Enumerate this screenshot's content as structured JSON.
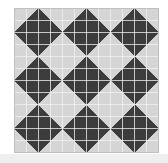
{
  "artwork": {
    "title": "Quilt block pattern",
    "kind": "patchwork-quilt-grid",
    "description": "Monochrome patchwork quilt swatch of repeating pinwheel / friendship star blocks",
    "grid": {
      "cells_across": 12,
      "cells_down": 12,
      "block_size_cells": 4,
      "blocks_across": 3,
      "blocks_down": 3,
      "cell_px": 12.0833
    },
    "colors": {
      "light_patch": "#d5d5d5",
      "dark_patch": "#3c3c3c",
      "seam_line": "#f2f2f2",
      "background": "#ffffff",
      "bottom_band": "#efefef",
      "outer_edge": "#bdbdbd"
    },
    "block_pattern": {
      "name": "pinwheel-star",
      "note": "Each 4x4 block: dark 2x2 center offset plus four half-square-triangle points spinning clockwise",
      "units": [
        {
          "row": 0,
          "col": 1,
          "type": "hst",
          "orientation": "br"
        },
        {
          "row": 0,
          "col": 2,
          "type": "hst",
          "orientation": "bl"
        },
        {
          "row": 1,
          "col": 0,
          "type": "hst",
          "orientation": "br"
        },
        {
          "row": 1,
          "col": 1,
          "type": "solid-dark"
        },
        {
          "row": 1,
          "col": 2,
          "type": "solid-dark"
        },
        {
          "row": 1,
          "col": 3,
          "type": "hst",
          "orientation": "bl"
        },
        {
          "row": 2,
          "col": 0,
          "type": "hst",
          "orientation": "tr"
        },
        {
          "row": 2,
          "col": 1,
          "type": "solid-dark"
        },
        {
          "row": 2,
          "col": 2,
          "type": "solid-dark"
        },
        {
          "row": 2,
          "col": 3,
          "type": "hst",
          "orientation": "tl"
        },
        {
          "row": 3,
          "col": 1,
          "type": "hst",
          "orientation": "tr"
        },
        {
          "row": 3,
          "col": 2,
          "type": "hst",
          "orientation": "tl"
        }
      ]
    }
  }
}
